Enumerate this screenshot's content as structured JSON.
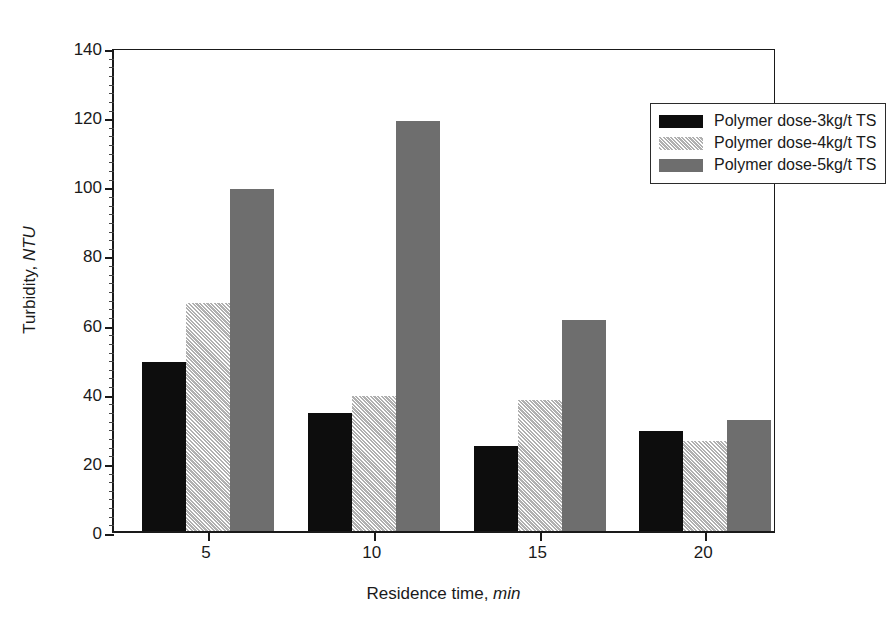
{
  "chart_data": {
    "type": "bar",
    "title": "",
    "xlabel": "Residence time, min",
    "xlabel_plain": "Residence time,",
    "xlabel_italic": "min",
    "ylabel": "Turbidity, NTU",
    "ylabel_plain": "Turbidity,",
    "ylabel_italic": "NTU",
    "categories": [
      "5",
      "10",
      "15",
      "20"
    ],
    "category_values": [
      5,
      10,
      15,
      20
    ],
    "series": [
      {
        "name": "Polymer dose-3kg/t TS",
        "pattern": "solid-black",
        "color": "#0d0d0d",
        "values": [
          49,
          34,
          24.5,
          29
        ]
      },
      {
        "name": "Polymer dose-4kg/t TS",
        "pattern": "diagonal-hatch",
        "color": "#c9c9c9",
        "values": [
          66,
          39,
          38,
          26
        ]
      },
      {
        "name": "Polymer dose-5kg/t TS",
        "pattern": "solid-gray",
        "color": "#6e6e6e",
        "values": [
          99,
          118.5,
          61,
          32
        ]
      }
    ],
    "ylim": [
      0,
      140
    ],
    "ytick_step": 20,
    "yticks": [
      0,
      20,
      40,
      60,
      80,
      100,
      120,
      140
    ],
    "ytick_labels": [
      "0",
      "20",
      "40",
      "60",
      "80",
      "100",
      "120",
      "140"
    ],
    "yminor_step": 2.5,
    "grid": false,
    "legend_position": "top-right",
    "legend_entries": [
      "Polymer dose-3kg/t TS",
      "Polymer dose-4kg/t TS",
      "Polymer dose-5kg/t TS"
    ],
    "annotations": []
  }
}
